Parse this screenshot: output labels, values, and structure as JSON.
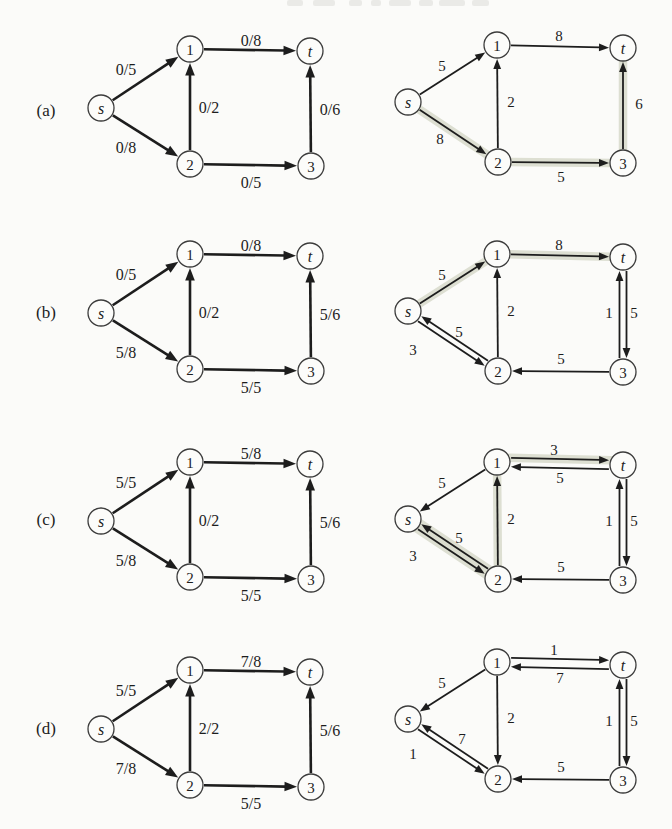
{
  "figure": {
    "colors": {
      "background": "#fbfbf9",
      "ink": "#1d1d1d",
      "node_fill": "#fcfcfa",
      "node_stroke": "#3c3c3c",
      "highlight": "#dadcce",
      "header_remnant": "#e8e8e4"
    },
    "node_radius": 13,
    "header_remnant_blocks": [
      [
        287,
        16
      ],
      [
        313,
        22
      ],
      [
        349,
        13
      ],
      [
        371,
        10
      ],
      [
        389,
        22
      ],
      [
        419,
        14
      ],
      [
        439,
        26
      ],
      [
        472,
        17
      ]
    ],
    "row_labels": [
      {
        "text": "(a)",
        "x": 46,
        "y": 110
      },
      {
        "text": "(b)",
        "x": 46,
        "y": 312
      },
      {
        "text": "(c)",
        "x": 46,
        "y": 519
      },
      {
        "text": "(d)",
        "x": 46,
        "y": 728
      }
    ],
    "node_templates": {
      "left": {
        "s": [
          22,
          72
        ],
        "1": [
          111,
          13
        ],
        "2": [
          111,
          128
        ],
        "t": [
          231,
          15
        ],
        "3": [
          232,
          130
        ]
      },
      "right": {
        "s": [
          28,
          66
        ],
        "1": [
          117,
          9
        ],
        "2": [
          118,
          126
        ],
        "t": [
          243,
          12
        ],
        "3": [
          243,
          127
        ]
      }
    },
    "node_label_styles": {
      "s": "italic",
      "t": "italic",
      "1": "normal",
      "2": "normal",
      "3": "normal"
    },
    "style": {
      "left": {
        "stroke_width": 2.6,
        "arrow_len": 12.5,
        "arrow_half": 4.8,
        "label_size": 16
      },
      "right": {
        "stroke_width": 1.8,
        "arrow_len": 10,
        "arrow_half": 3.9,
        "label_size": 15
      }
    },
    "graphs": [
      {
        "id": "a-left",
        "x": 79,
        "y": 36,
        "template": "left",
        "edges": [
          {
            "from": "s",
            "to": "1",
            "label": "0/5",
            "lx": 47,
            "ly": 33
          },
          {
            "from": "s",
            "to": "2",
            "label": "0/8",
            "lx": 47,
            "ly": 111
          },
          {
            "from": "2",
            "to": "1",
            "label": "0/2",
            "lx": 130,
            "ly": 71
          },
          {
            "from": "1",
            "to": "t",
            "label": "0/8",
            "lx": 172,
            "ly": 4
          },
          {
            "from": "2",
            "to": "3",
            "label": "0/5",
            "lx": 172,
            "ly": 146
          },
          {
            "from": "3",
            "to": "t",
            "label": "0/6",
            "lx": 251,
            "ly": 73
          }
        ]
      },
      {
        "id": "a-right",
        "x": 380,
        "y": 36,
        "template": "right",
        "edges": [
          {
            "from": "s",
            "to": "1",
            "label": "5",
            "lx": 62,
            "ly": 30
          },
          {
            "from": "s",
            "to": "2",
            "label": "8",
            "lx": 60,
            "ly": 103,
            "highlight": true
          },
          {
            "from": "2",
            "to": "1",
            "label": "2",
            "lx": 131,
            "ly": 66
          },
          {
            "from": "1",
            "to": "t",
            "label": "8",
            "lx": 179,
            "ly": 0
          },
          {
            "from": "2",
            "to": "3",
            "label": "5",
            "lx": 181,
            "ly": 141,
            "highlight": true
          },
          {
            "from": "3",
            "to": "t",
            "label": "6",
            "lx": 259,
            "ly": 68,
            "highlight": true
          }
        ]
      },
      {
        "id": "b-left",
        "x": 79,
        "y": 241,
        "template": "left",
        "edges": [
          {
            "from": "s",
            "to": "1",
            "label": "0/5",
            "lx": 47,
            "ly": 33
          },
          {
            "from": "s",
            "to": "2",
            "label": "5/8",
            "lx": 47,
            "ly": 111
          },
          {
            "from": "2",
            "to": "1",
            "label": "0/2",
            "lx": 130,
            "ly": 71
          },
          {
            "from": "1",
            "to": "t",
            "label": "0/8",
            "lx": 172,
            "ly": 4
          },
          {
            "from": "2",
            "to": "3",
            "label": "5/5",
            "lx": 172,
            "ly": 146
          },
          {
            "from": "3",
            "to": "t",
            "label": "5/6",
            "lx": 251,
            "ly": 73
          }
        ]
      },
      {
        "id": "b-right",
        "x": 380,
        "y": 245,
        "template": "right",
        "edges": [
          {
            "from": "s",
            "to": "1",
            "label": "5",
            "lx": 62,
            "ly": 30,
            "highlight": true
          },
          {
            "from": "1",
            "to": "t",
            "label": "8",
            "lx": 179,
            "ly": 0,
            "highlight": true
          },
          {
            "from": "2",
            "to": "s",
            "label": "5",
            "lx": 79,
            "ly": 87,
            "offset": 3
          },
          {
            "from": "s",
            "to": "2",
            "label": "3",
            "lx": 33,
            "ly": 105,
            "offset": 3
          },
          {
            "from": "2",
            "to": "1",
            "label": "2",
            "lx": 131,
            "ly": 66
          },
          {
            "from": "3",
            "to": "2",
            "label": "5",
            "lx": 181,
            "ly": 114
          },
          {
            "from": "3",
            "to": "t",
            "label": "1",
            "lx": 229,
            "ly": 68,
            "offset": -3.5
          },
          {
            "from": "t",
            "to": "3",
            "label": "5",
            "lx": 254,
            "ly": 68,
            "offset": -3.5
          }
        ]
      },
      {
        "id": "c-left",
        "x": 79,
        "y": 449,
        "template": "left",
        "edges": [
          {
            "from": "s",
            "to": "1",
            "label": "5/5",
            "lx": 47,
            "ly": 33
          },
          {
            "from": "s",
            "to": "2",
            "label": "5/8",
            "lx": 47,
            "ly": 111
          },
          {
            "from": "2",
            "to": "1",
            "label": "0/2",
            "lx": 130,
            "ly": 71
          },
          {
            "from": "1",
            "to": "t",
            "label": "5/8",
            "lx": 172,
            "ly": 4
          },
          {
            "from": "2",
            "to": "3",
            "label": "5/5",
            "lx": 172,
            "ly": 146
          },
          {
            "from": "3",
            "to": "t",
            "label": "5/6",
            "lx": 251,
            "ly": 73
          }
        ]
      },
      {
        "id": "c-right",
        "x": 380,
        "y": 453,
        "template": "right",
        "edges": [
          {
            "from": "1",
            "to": "s",
            "label": "5",
            "lx": 62,
            "ly": 30
          },
          {
            "from": "1",
            "to": "t",
            "label": "3",
            "lx": 174,
            "ly": -3,
            "offset": -4.5,
            "highlight": true
          },
          {
            "from": "t",
            "to": "1",
            "label": "5",
            "lx": 180,
            "ly": 25,
            "offset": -4.5
          },
          {
            "from": "2",
            "to": "s",
            "label": "5",
            "lx": 79,
            "ly": 85,
            "offset": 3,
            "highlight": true
          },
          {
            "from": "s",
            "to": "2",
            "label": "3",
            "lx": 33,
            "ly": 103,
            "offset": 3,
            "highlight": true
          },
          {
            "from": "2",
            "to": "1",
            "label": "2",
            "lx": 131,
            "ly": 66,
            "highlight": true
          },
          {
            "from": "3",
            "to": "2",
            "label": "5",
            "lx": 181,
            "ly": 114
          },
          {
            "from": "3",
            "to": "t",
            "label": "1",
            "lx": 229,
            "ly": 68,
            "offset": -3.5
          },
          {
            "from": "t",
            "to": "3",
            "label": "5",
            "lx": 254,
            "ly": 68,
            "offset": -3.5
          }
        ]
      },
      {
        "id": "d-left",
        "x": 79,
        "y": 657,
        "template": "left",
        "edges": [
          {
            "from": "s",
            "to": "1",
            "label": "5/5",
            "lx": 47,
            "ly": 33
          },
          {
            "from": "s",
            "to": "2",
            "label": "7/8",
            "lx": 47,
            "ly": 111
          },
          {
            "from": "2",
            "to": "1",
            "label": "2/2",
            "lx": 130,
            "ly": 71
          },
          {
            "from": "1",
            "to": "t",
            "label": "7/8",
            "lx": 172,
            "ly": 4
          },
          {
            "from": "2",
            "to": "3",
            "label": "5/5",
            "lx": 172,
            "ly": 146
          },
          {
            "from": "3",
            "to": "t",
            "label": "5/6",
            "lx": 251,
            "ly": 73
          }
        ]
      },
      {
        "id": "d-right",
        "x": 380,
        "y": 653,
        "template": "right",
        "edges": [
          {
            "from": "1",
            "to": "s",
            "label": "5",
            "lx": 62,
            "ly": 30
          },
          {
            "from": "1",
            "to": "t",
            "label": "1",
            "lx": 174,
            "ly": -3,
            "offset": -4.5
          },
          {
            "from": "t",
            "to": "1",
            "label": "7",
            "lx": 180,
            "ly": 25,
            "offset": -4.5
          },
          {
            "from": "2",
            "to": "s",
            "label": "7",
            "lx": 82,
            "ly": 86,
            "offset": 3
          },
          {
            "from": "s",
            "to": "2",
            "label": "1",
            "lx": 33,
            "ly": 101,
            "offset": 3
          },
          {
            "from": "1",
            "to": "2",
            "label": "2",
            "lx": 131,
            "ly": 65
          },
          {
            "from": "3",
            "to": "2",
            "label": "5",
            "lx": 181,
            "ly": 114
          },
          {
            "from": "3",
            "to": "t",
            "label": "1",
            "lx": 229,
            "ly": 68,
            "offset": -3.5
          },
          {
            "from": "t",
            "to": "3",
            "label": "5",
            "lx": 254,
            "ly": 68,
            "offset": -3.5
          }
        ]
      }
    ]
  }
}
